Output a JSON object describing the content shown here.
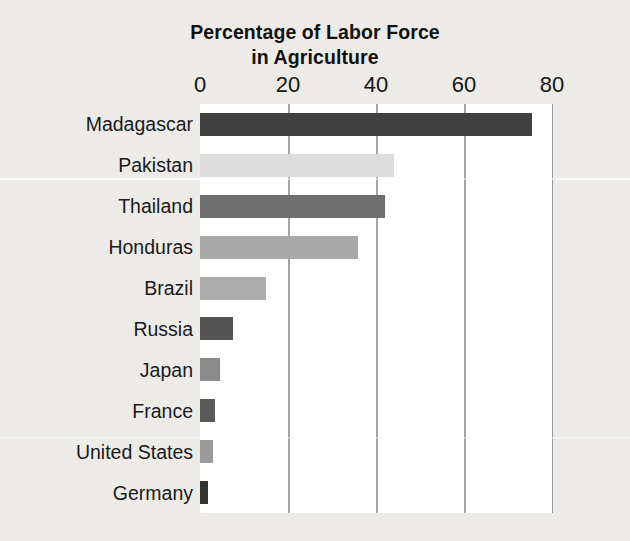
{
  "chart_data": {
    "type": "bar",
    "orientation": "horizontal",
    "title_line1": "Percentage of Labor Force",
    "title_line2": "in Agriculture",
    "xlabel": "",
    "ylabel": "",
    "xlim": [
      0,
      80
    ],
    "ticks": [
      0,
      20,
      40,
      60,
      80
    ],
    "tick_labels": [
      "0",
      "20",
      "40",
      "60",
      "80"
    ],
    "grid": "vertical",
    "legend": "none",
    "axis_position": "top",
    "categories": [
      "Madagascar",
      "Pakistan",
      "Thailand",
      "Honduras",
      "Brazil",
      "Russia",
      "Japan",
      "France",
      "United States",
      "Germany"
    ],
    "values": [
      75.5,
      44,
      42,
      36,
      15,
      7.5,
      4.5,
      3.4,
      3,
      1.8
    ],
    "bar_colors": [
      "#3f3f3f",
      "#dcdcdc",
      "#6e6e6e",
      "#a9a9a9",
      "#ababab",
      "#555555",
      "#8a8a8a",
      "#5a5a5a",
      "#9b9b9b",
      "#333333"
    ]
  },
  "style": {
    "page_background": "#ecebe8",
    "plot_background": "#ffffff",
    "gridline_color": "#a4a4a4",
    "text_color": "#1a1a1a"
  }
}
